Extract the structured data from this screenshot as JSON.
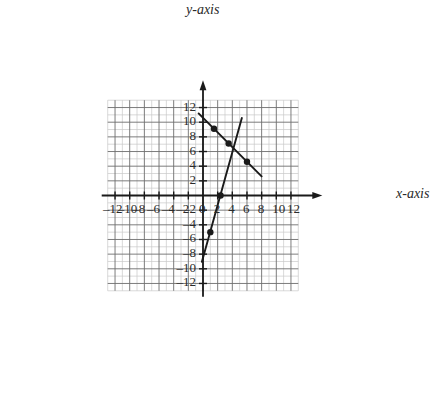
{
  "figure": {
    "kind": "coordinate-grid",
    "x_axis_label": "x-axis",
    "y_axis_label": "y-axis",
    "background": "#ffffff",
    "grid_minor_color": "#c9c9c9",
    "grid_major_color": "#6e6e6e",
    "axis_color": "#1a1a1a",
    "line_color": "#1a1a1a",
    "label_color": "#2a2a2a"
  },
  "chart_data": {
    "type": "line",
    "title": "",
    "xlabel": "x-axis",
    "ylabel": "y-axis",
    "xlim": [
      -13,
      13
    ],
    "ylim": [
      -13,
      13
    ],
    "grid": true,
    "grid_step_minor": 1,
    "grid_step_major": 2,
    "legend": "none",
    "xticks": [
      -12,
      -10,
      -8,
      -6,
      -4,
      -2,
      0,
      2,
      4,
      6,
      8,
      10,
      12
    ],
    "yticks": [
      -12,
      -10,
      -8,
      -6,
      -4,
      -2,
      2,
      4,
      6,
      8,
      10,
      12
    ],
    "xtick_labels": [
      "–12",
      "–10",
      "–8",
      "–6",
      "–4",
      "–2",
      "0",
      "2",
      "4",
      "6",
      "8",
      "10",
      "12"
    ],
    "ytick_labels": [
      "–12",
      "–10",
      "–8",
      "–6",
      "–4",
      "–2",
      "2",
      "4",
      "6",
      "8",
      "10",
      "12"
    ],
    "series": [
      {
        "name": "decreasing-line",
        "slope": -1,
        "intercept": 10.6,
        "x_start": -0.6,
        "x_end": 8.0,
        "points": [
          {
            "x": 1.5,
            "y": 9.1
          },
          {
            "x": 3.5,
            "y": 7.1
          },
          {
            "x": 6.0,
            "y": 4.6
          }
        ]
      },
      {
        "name": "increasing-line",
        "slope": 3.6,
        "intercept": -8.5,
        "x_start": -0.15,
        "x_end": 5.3,
        "points": [
          {
            "x": 1.0,
            "y": -5.0
          },
          {
            "x": 2.4,
            "y": 0.0
          },
          {
            "x": 6.0,
            "y": 4.6
          }
        ]
      }
    ],
    "intersection": {
      "x": 6.0,
      "y": 4.6
    }
  }
}
